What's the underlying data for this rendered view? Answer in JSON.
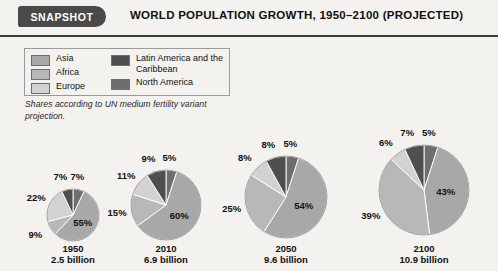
{
  "header": {
    "badge_label": "SNAPSHOT",
    "title": "WORLD POPULATION GROWTH, 1950–2100 (PROJECTED)"
  },
  "legend": {
    "items": [
      {
        "label": "Asia",
        "color": "#a8a8a8"
      },
      {
        "label": "Africa",
        "color": "#b8b8b8"
      },
      {
        "label": "Europe",
        "color": "#d2d2d2"
      },
      {
        "label": "Latin America and the Caribbean",
        "color": "#4f4f4f"
      },
      {
        "label": "North America",
        "color": "#6e6e6e"
      }
    ],
    "column_a": [
      "Asia",
      "Africa",
      "Europe"
    ],
    "column_b": [
      "Latin America and the Caribbean",
      "North America"
    ]
  },
  "caption": "Shares according to UN medium fertility variant projection.",
  "chart_data": {
    "type": "pie",
    "title": "WORLD POPULATION GROWTH, 1950–2100 (PROJECTED)",
    "subtitle": "Shares according to UN medium fertility variant projection.",
    "legend_position": "top-left",
    "unit": "percent of world population",
    "categories": [
      "Asia",
      "Africa",
      "Europe",
      "Latin America and the Caribbean",
      "North America"
    ],
    "colors": [
      "#a8a8a8",
      "#b8b8b8",
      "#d2d2d2",
      "#4f4f4f",
      "#6e6e6e"
    ],
    "charts": [
      {
        "year": "1950",
        "population": "2.5 billion",
        "radius_px": 26,
        "values": [
          55,
          9,
          22,
          7,
          7
        ],
        "labels": [
          "55%",
          "9%",
          "22%",
          "7%",
          "7%"
        ]
      },
      {
        "year": "2010",
        "population": "6.9 billion",
        "radius_px": 35,
        "values": [
          60,
          15,
          11,
          9,
          5
        ],
        "labels": [
          "60%",
          "15%",
          "11%",
          "9%",
          "5%"
        ]
      },
      {
        "year": "2050",
        "population": "9.6 billion",
        "radius_px": 41,
        "values": [
          54,
          25,
          8,
          8,
          5
        ],
        "labels": [
          "54%",
          "25%",
          "8%",
          "8%",
          "5%"
        ]
      },
      {
        "year": "2100",
        "population": "10.9 billion",
        "radius_px": 45,
        "values": [
          43,
          39,
          6,
          7,
          5
        ],
        "labels": [
          "43%",
          "39%",
          "6%",
          "7%",
          "5%"
        ]
      }
    ]
  }
}
